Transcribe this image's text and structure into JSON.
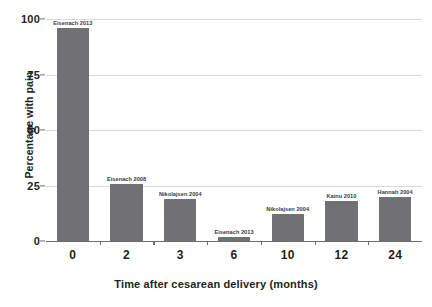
{
  "chart_data": {
    "type": "bar",
    "title": "",
    "xlabel": "Time after cesarean delivery (months)",
    "ylabel": "Percentage with pain",
    "categories": [
      "0",
      "2",
      "3",
      "6",
      "10",
      "12",
      "24"
    ],
    "values": [
      96,
      25.5,
      19,
      2,
      12,
      18,
      20
    ],
    "point_labels": [
      "Eisenach 2013",
      "Eisenach 2008",
      "Nikolajsen 2004",
      "Eisenach 2013",
      "Nikolajsen 2004",
      "Kainu 2010",
      "Hannah 2004"
    ],
    "ylim": [
      0,
      100
    ],
    "yticks": [
      0,
      25,
      50,
      75,
      100
    ],
    "ytick_labels": [
      "0",
      "25",
      "50",
      "75",
      "100"
    ],
    "grid": true,
    "legend": "none",
    "bar_color": "#717073",
    "grid_color": "#d9d9d9",
    "axis_color": "#6d6e71",
    "text_color": "#231f20"
  }
}
